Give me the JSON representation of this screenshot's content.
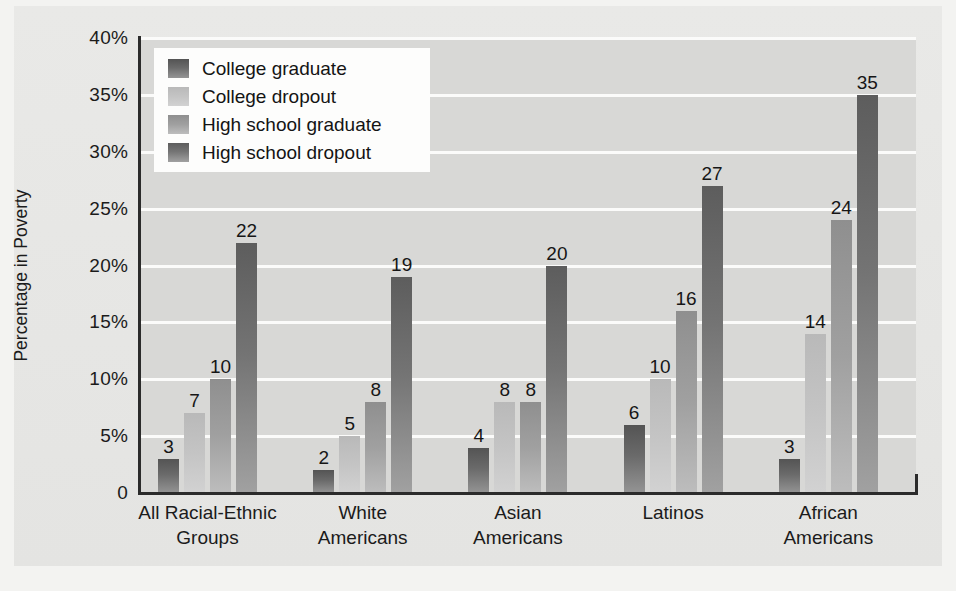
{
  "chart_data": {
    "type": "bar",
    "title": "",
    "subtitle": "",
    "xlabel": "",
    "ylabel": "Percentage in Poverty",
    "ylim": [
      0,
      40
    ],
    "ytick_values": [
      0,
      5,
      10,
      15,
      20,
      25,
      30,
      35,
      40
    ],
    "ytick_labels": [
      "0",
      "5%",
      "10%",
      "15%",
      "20%",
      "25%",
      "30%",
      "35%",
      "40%"
    ],
    "grid": "horizontal",
    "legend_position": "upper-left-inside",
    "value_labels": true,
    "units": "percent",
    "categories": [
      "All Racial-Ethnic Groups",
      "White Americans",
      "Asian Americans",
      "Latinos",
      "African Americans"
    ],
    "category_lines": [
      [
        "All Racial-Ethnic",
        "Groups"
      ],
      [
        "White",
        "Americans"
      ],
      [
        "Asian",
        "Americans"
      ],
      [
        "Latinos",
        ""
      ],
      [
        "African",
        "Americans"
      ]
    ],
    "series": [
      {
        "name": "College graduate",
        "color": "#5a5a5a",
        "values": [
          3,
          2,
          4,
          6,
          3
        ]
      },
      {
        "name": "College dropout",
        "color": "#c2c2c2",
        "values": [
          7,
          5,
          8,
          10,
          14
        ]
      },
      {
        "name": "High school graduate",
        "color": "#9e9e9e",
        "values": [
          10,
          8,
          8,
          16,
          24
        ]
      },
      {
        "name": "High school dropout",
        "color": "#646464",
        "values": [
          22,
          19,
          20,
          27,
          35
        ]
      }
    ],
    "colors": {
      "plot_background": "#d8d8d6",
      "panel_background": "#e6e6e4",
      "page_background": "#f3f3f1",
      "gridline": "#fbfbfa",
      "axis": "#2b2b2b",
      "text": "#1b1b1b",
      "legend_background": "#fdfdfc"
    }
  }
}
